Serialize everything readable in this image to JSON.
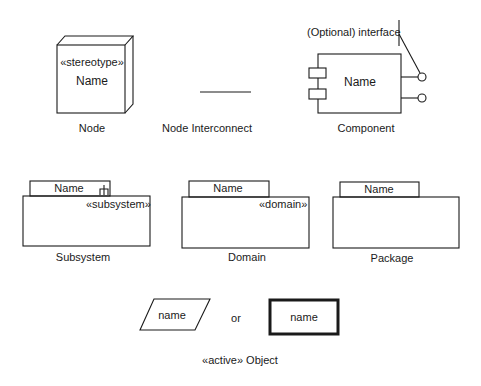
{
  "node": {
    "stereotype": "«stereotype»",
    "name": "Name",
    "caption": "Node"
  },
  "interconnect": {
    "caption": "Node Interconnect"
  },
  "component": {
    "interface_label": "(Optional) interface",
    "name": "Name",
    "caption": "Component"
  },
  "subsystem": {
    "name": "Name",
    "stereotype": "«subsystem»",
    "caption": "Subsystem"
  },
  "domain": {
    "name": "Name",
    "stereotype": "«domain»",
    "caption": "Domain"
  },
  "package": {
    "name": "Name",
    "caption": "Package"
  },
  "active_object": {
    "parallelogram_name": "name",
    "or_label": "or",
    "box_name": "name",
    "caption": "«active» Object"
  },
  "colors": {
    "stroke": "#1a1a1a",
    "background": "#ffffff"
  }
}
